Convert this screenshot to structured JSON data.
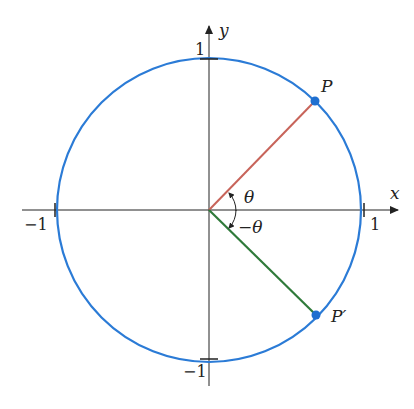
{
  "figure": {
    "axes": {
      "x_label": "x",
      "y_label": "y",
      "ticks": {
        "x_pos": "1",
        "x_neg": "−1",
        "y_pos": "1",
        "y_neg": "−1"
      }
    },
    "points": {
      "P": "P",
      "P_prime": "P′"
    },
    "angles": {
      "theta": "θ",
      "neg_theta": "−θ"
    },
    "colors": {
      "circle": "#2b7bd6",
      "radius_P": "#c8645a",
      "radius_P_prime": "#2f7a3a",
      "axes": "#222222",
      "points": "#1f6fd0"
    }
  }
}
